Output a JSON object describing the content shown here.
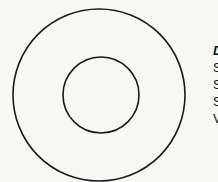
{
  "diagram": {
    "outer_circle": {
      "cx": 99,
      "cy": 95,
      "r": 86,
      "stroke": "#1a1a1a",
      "stroke_width": 1.6
    },
    "inner_circle": {
      "cx": 101,
      "cy": 95,
      "r": 38,
      "stroke": "#1a1a1a",
      "stroke_width": 1.6
    },
    "labels": {
      "title": "D",
      "lines": [
        "S",
        "S",
        "S",
        "V"
      ]
    }
  }
}
